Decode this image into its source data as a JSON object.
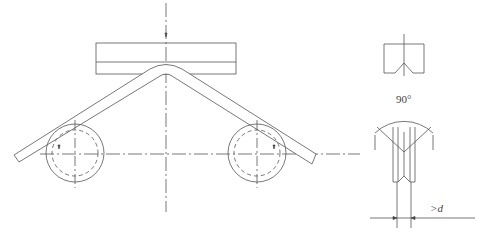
{
  "diagram": {
    "labels": {
      "angle": "90°",
      "distance": ">d"
    },
    "components": [
      "upper-punch",
      "bent-specimen",
      "left-support-roller",
      "right-support-roller",
      "punch-side-view",
      "roller-side-view"
    ],
    "colors": {
      "line": "#555555",
      "background": "#ffffff"
    }
  }
}
